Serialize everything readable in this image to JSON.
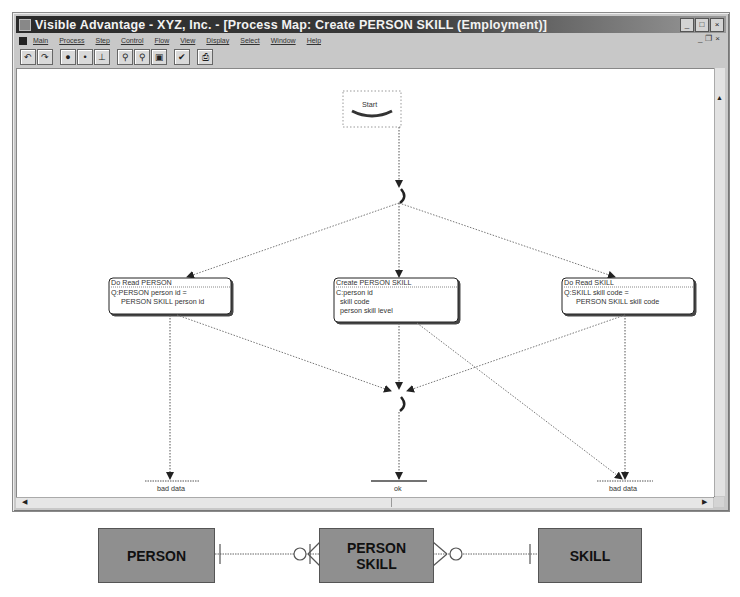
{
  "window": {
    "title": "Visible Advantage - XYZ, Inc. - [Process Map: Create PERSON SKILL (Employment)]",
    "controls": [
      "minimize",
      "maximize",
      "close"
    ],
    "mdi_controls": [
      "minimize",
      "restore",
      "close"
    ]
  },
  "menubar": {
    "items": [
      {
        "label": "Main"
      },
      {
        "label": "Process"
      },
      {
        "label": "Step"
      },
      {
        "label": "Control"
      },
      {
        "label": "Flow"
      },
      {
        "label": "View"
      },
      {
        "label": "Display"
      },
      {
        "label": "Select"
      },
      {
        "label": "Window"
      },
      {
        "label": "Help"
      }
    ]
  },
  "toolbar": {
    "groups": [
      [
        {
          "icon": "undo-icon",
          "glyph": "↶"
        },
        {
          "icon": "redo-icon",
          "glyph": "↷"
        }
      ],
      [
        {
          "icon": "large-dot-icon",
          "glyph": "●"
        },
        {
          "icon": "small-dot-icon",
          "glyph": "•"
        },
        {
          "icon": "anchor-icon",
          "glyph": "⊥"
        }
      ],
      [
        {
          "icon": "zoom-in-icon",
          "glyph": "⚲"
        },
        {
          "icon": "zoom-out-icon",
          "glyph": "⚲"
        },
        {
          "icon": "fit-view-icon",
          "glyph": "▣"
        }
      ],
      [
        {
          "icon": "check-icon",
          "glyph": "✔"
        }
      ],
      [
        {
          "icon": "print-icon",
          "glyph": "⎙"
        }
      ]
    ]
  },
  "process_map": {
    "start": {
      "label": "Start"
    },
    "steps": [
      {
        "id": "read-person",
        "title": "Do Read PERSON",
        "lines": [
          "Q:PERSON person id =",
          "PERSON SKILL person id"
        ]
      },
      {
        "id": "create-person-skill",
        "title": "Create PERSON SKILL",
        "lines": [
          "C:person id",
          "skill code",
          "person skill level"
        ]
      },
      {
        "id": "read-skill",
        "title": "Do Read SKILL",
        "lines": [
          "Q:SKILL skill code =",
          "PERSON SKILL skill code"
        ]
      }
    ],
    "endpoints": [
      {
        "id": "bad-data-left",
        "label": "bad data"
      },
      {
        "id": "ok",
        "label": "ok"
      },
      {
        "id": "bad-data-right",
        "label": "bad data"
      }
    ]
  },
  "erd": {
    "entities": [
      {
        "id": "person",
        "label": "PERSON"
      },
      {
        "id": "person-skill",
        "label_line1": "PERSON",
        "label_line2": "SKILL"
      },
      {
        "id": "skill",
        "label": "SKILL"
      }
    ],
    "colors": {
      "entity_fill": "#8f8f8f",
      "line": "#666666"
    }
  }
}
